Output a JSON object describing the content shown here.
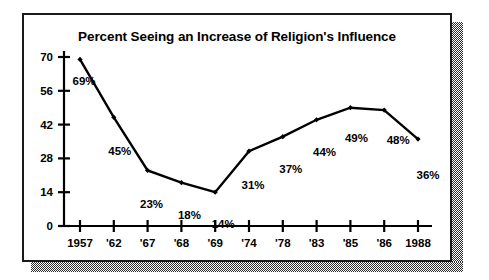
{
  "chart_data": {
    "type": "line",
    "title": "Percent Seeing an Increase of Religion's Influence",
    "xlabel": "",
    "ylabel": "",
    "categories": [
      "1957",
      "'62",
      "'67",
      "'68",
      "'69",
      "'74",
      "'78",
      "'83",
      "'85",
      "'86",
      "1988"
    ],
    "values": [
      69,
      45,
      23,
      18,
      14,
      31,
      37,
      44,
      49,
      48,
      36
    ],
    "point_labels": [
      "69%",
      "45%",
      "23%",
      "18%",
      "14%",
      "31%",
      "37%",
      "44%",
      "49%",
      "48%",
      "36%"
    ],
    "yticks": [
      0,
      14,
      28,
      42,
      56,
      70
    ],
    "ytick_labels": [
      "0",
      "14",
      "28",
      "42",
      "56",
      "70"
    ],
    "ylim": [
      0,
      70
    ],
    "grid": false,
    "legend": false,
    "line_color": "#000000",
    "marker": "diamond",
    "marker_color": "#000000"
  },
  "figure": {
    "title": "Percent Seeing an Increase of Religion's Influence",
    "frame_color": "#1a1a1a",
    "background_color": "#ffffff",
    "shadow_color": "#2a2a2a"
  }
}
